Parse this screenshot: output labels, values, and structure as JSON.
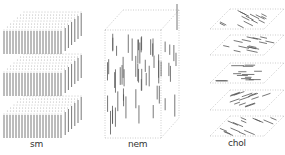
{
  "figure": {
    "panels": [
      {
        "id": "smectic",
        "label": "sm",
        "layers": 3
      },
      {
        "id": "nematic",
        "label": "nem"
      },
      {
        "id": "cholesteric",
        "label": "chol",
        "planes": 5
      }
    ],
    "colors": {
      "molecule": "#555555",
      "outline": "#999999",
      "background": "#ffffff"
    }
  }
}
